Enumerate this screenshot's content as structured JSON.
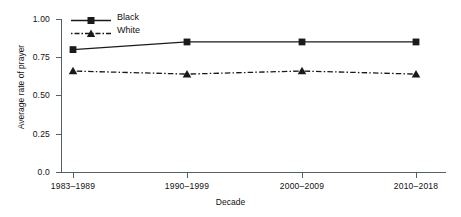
{
  "chart_data": {
    "type": "line",
    "title": "",
    "subtitle": "",
    "xlabel": "Decade",
    "ylabel": "Average rate of prayer",
    "categories": [
      "1983–1989",
      "1990–1999",
      "2000–2009",
      "2010–2018"
    ],
    "series": [
      {
        "name": "Black",
        "values": [
          0.8,
          0.85,
          0.85,
          0.85
        ],
        "marker": "square",
        "linestyle": "solid",
        "color": "#1a1a1a"
      },
      {
        "name": "White",
        "values": [
          0.66,
          0.64,
          0.66,
          0.64
        ],
        "marker": "triangle",
        "linestyle": "dashdot",
        "color": "#1a1a1a"
      }
    ],
    "ylim": [
      0.0,
      1.0
    ],
    "yticks": [
      0.0,
      0.25,
      0.5,
      0.75,
      1.0
    ],
    "ytick_labels": [
      "0.0",
      "0.25",
      "0.50",
      "0.75",
      "1.00"
    ],
    "grid": false,
    "legend_position": "top-left-inside",
    "axis_color": "#555f66",
    "background": "#ffffff"
  },
  "legend": {
    "entries": [
      {
        "label": "Black"
      },
      {
        "label": "White"
      }
    ]
  },
  "axes": {
    "y_title": "Average rate of prayer",
    "x_title": "Decade",
    "y_labels": [
      "1.00",
      "0.75",
      "0.50",
      "0.25",
      "0.0"
    ],
    "x_labels": [
      "1983–1989",
      "1990–1999",
      "2000–2009",
      "2010–2018"
    ]
  }
}
